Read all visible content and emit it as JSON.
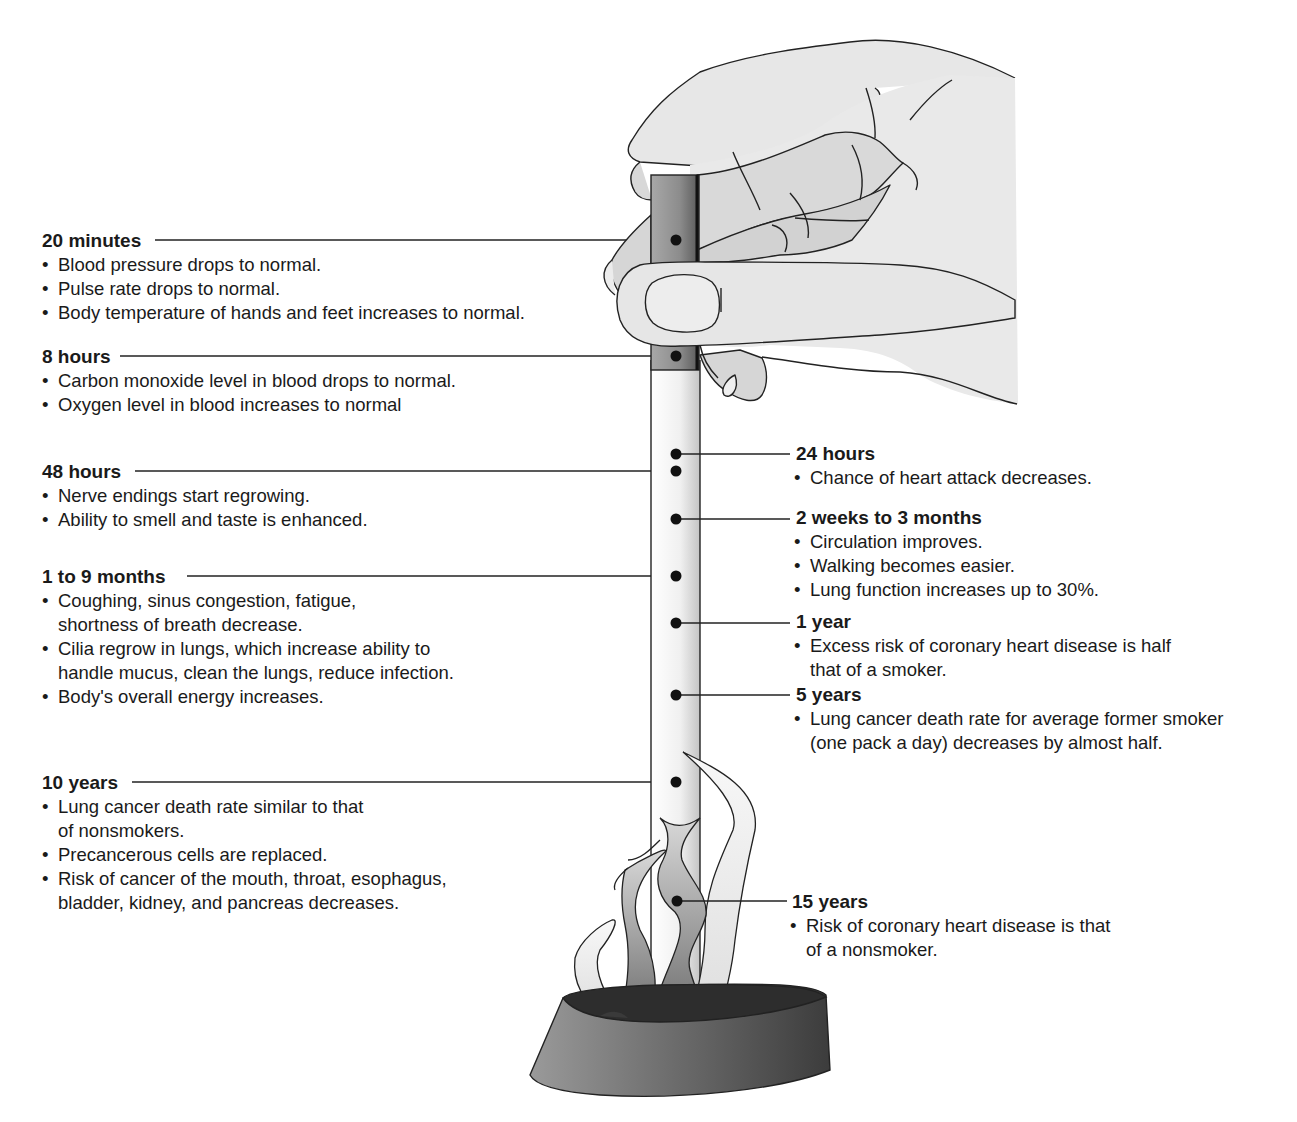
{
  "diagram": {
    "colors": {
      "text": "#1a1a1a",
      "line": "#222222",
      "hand_fill": "#e6e6e6",
      "hand_shadow": "#cfcfcf",
      "filter_band": "#8f8f8f",
      "stick": "#f2f2f2",
      "flame_dark": "#7a7a7a",
      "flame_light": "#ededed",
      "base": "#6e6e6e"
    },
    "left_milestones": [
      {
        "id": "20-minutes",
        "time": "20 minutes",
        "items": [
          "Blood pressure drops to normal.",
          "Pulse rate drops to normal.",
          "Body temperature of hands and feet increases to normal."
        ]
      },
      {
        "id": "8-hours",
        "time": "8 hours",
        "items": [
          "Carbon monoxide level in blood drops to normal.",
          "Oxygen level in blood increases to normal"
        ]
      },
      {
        "id": "48-hours",
        "time": "48 hours",
        "items": [
          "Nerve endings start regrowing.",
          "Ability to smell and taste is enhanced."
        ]
      },
      {
        "id": "1-to-9-months",
        "time": "1 to 9 months",
        "items": [
          [
            "Coughing, sinus congestion, fatigue,",
            "shortness of breath decrease."
          ],
          [
            "Cilia regrow in lungs, which increase ability to",
            "handle mucus, clean the lungs, reduce infection."
          ],
          "Body's overall energy increases."
        ]
      },
      {
        "id": "10-years",
        "time": "10 years",
        "items": [
          [
            "Lung cancer death rate similar to that",
            "of nonsmokers."
          ],
          "Precancerous cells are replaced.",
          [
            "Risk of cancer of the mouth, throat, esophagus,",
            "bladder, kidney, and pancreas decreases."
          ]
        ]
      }
    ],
    "right_milestones": [
      {
        "id": "24-hours",
        "time": "24 hours",
        "items": [
          "Chance of heart attack decreases."
        ]
      },
      {
        "id": "2-weeks-to-3-months",
        "time": "2 weeks to 3 months",
        "items": [
          "Circulation improves.",
          "Walking becomes easier.",
          "Lung function increases up to 30%."
        ]
      },
      {
        "id": "1-year",
        "time": "1 year",
        "items": [
          [
            "Excess risk of coronary heart disease is half",
            "that of a smoker."
          ]
        ]
      },
      {
        "id": "5-years",
        "time": "5 years",
        "items": [
          [
            "Lung cancer death rate for average former smoker",
            "(one pack a day) decreases by almost half."
          ]
        ]
      },
      {
        "id": "15-years",
        "time": "15 years",
        "items": [
          [
            "Risk of coronary heart disease is that",
            "of a nonsmoker."
          ]
        ]
      }
    ]
  }
}
